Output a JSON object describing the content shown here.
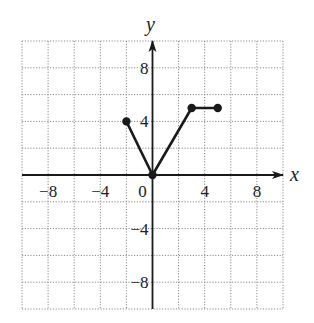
{
  "chart_data": {
    "type": "line",
    "title": "",
    "xlabel": "x",
    "ylabel": "y",
    "xlim": [
      -10,
      10
    ],
    "ylim": [
      -10,
      10
    ],
    "grid": true,
    "grid_step": 2,
    "x_ticks": [
      -8,
      -4,
      0,
      4,
      8
    ],
    "y_ticks": [
      8,
      4,
      -4,
      -8
    ],
    "x_tick_labels": [
      "−8",
      "−4",
      "0",
      "4",
      "8"
    ],
    "y_tick_labels": [
      "8",
      "4",
      "−4",
      "−8"
    ],
    "series": [
      {
        "name": "piecewise",
        "points": [
          [
            -2,
            4
          ],
          [
            0,
            0
          ],
          [
            3,
            5
          ],
          [
            5,
            5
          ]
        ],
        "markers": "closed-circle"
      }
    ],
    "colors": {
      "line": "#1a1a1a",
      "grid": "#8a8a8a",
      "axis": "#1a1a1a"
    }
  }
}
